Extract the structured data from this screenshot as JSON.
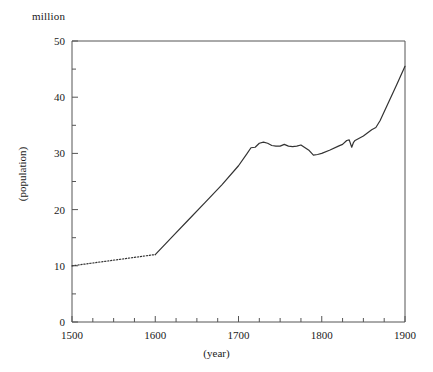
{
  "chart_data": {
    "type": "line",
    "title": "",
    "unit_label": "million",
    "xlabel": "(year)",
    "ylabel": "(population)",
    "xlim": [
      1500,
      1900
    ],
    "ylim": [
      0,
      50
    ],
    "grid": false,
    "legend": "none",
    "x_major_ticks": [
      1500,
      1600,
      1700,
      1800,
      1900
    ],
    "x_tick_labels": [
      "1500",
      "1600",
      "1700",
      "1800",
      "1900"
    ],
    "x_minor_tick_step": 25,
    "y_major_ticks": [
      0,
      10,
      20,
      30,
      40,
      50
    ],
    "y_tick_labels": [
      "0",
      "10",
      "20",
      "30",
      "40",
      "50"
    ],
    "y_minor_ticks": [
      5,
      15,
      25,
      35,
      45
    ],
    "series": [
      {
        "name": "estimated-population",
        "style": "dotted",
        "color": "#333333",
        "x": [
          1500,
          1520,
          1540,
          1560,
          1580,
          1600
        ],
        "values": [
          10.0,
          10.4,
          10.8,
          11.2,
          11.6,
          12.0
        ]
      },
      {
        "name": "recorded-population",
        "style": "solid",
        "color": "#333333",
        "x": [
          1600,
          1620,
          1640,
          1660,
          1680,
          1700,
          1710,
          1715,
          1720,
          1725,
          1730,
          1735,
          1740,
          1745,
          1750,
          1755,
          1760,
          1765,
          1770,
          1775,
          1780,
          1785,
          1790,
          1795,
          1800,
          1810,
          1820,
          1825,
          1830,
          1833,
          1836,
          1838,
          1840,
          1850,
          1860,
          1865,
          1870,
          1880,
          1890,
          1900
        ],
        "values": [
          12.0,
          15.1,
          18.2,
          21.3,
          24.4,
          27.8,
          29.9,
          31.0,
          31.1,
          31.8,
          32.0,
          31.8,
          31.4,
          31.3,
          31.3,
          31.6,
          31.3,
          31.2,
          31.3,
          31.5,
          31.0,
          30.5,
          29.7,
          29.8,
          30.0,
          30.6,
          31.3,
          31.6,
          32.3,
          32.4,
          31.1,
          31.9,
          32.3,
          33.1,
          34.2,
          34.6,
          35.8,
          39.0,
          42.2,
          45.5
        ]
      }
    ]
  }
}
